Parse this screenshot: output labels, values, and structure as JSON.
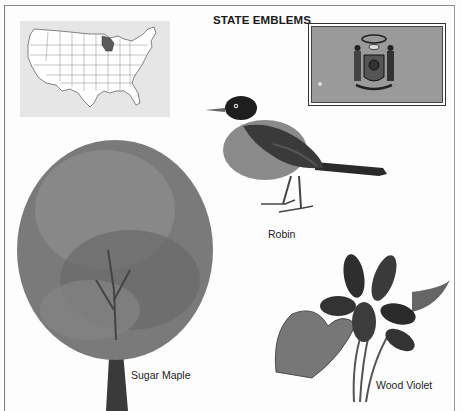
{
  "page": {
    "title": "STATE EMBLEMS",
    "state": "Wisconsin"
  },
  "map": {
    "description": "Outline map of the United States with Wisconsin highlighted",
    "highlight_color": "#5a5a5a",
    "background_color": "#e6e6e6"
  },
  "flag": {
    "description": "State flag with coat of arms",
    "field_color": "#9a9a9a"
  },
  "emblems": [
    {
      "id": "bird",
      "caption": "Robin"
    },
    {
      "id": "tree",
      "caption": "Sugar Maple"
    },
    {
      "id": "flower",
      "caption": "Wood Violet"
    }
  ]
}
